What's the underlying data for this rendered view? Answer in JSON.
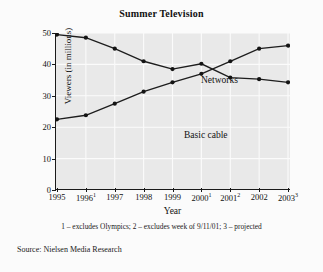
{
  "figure": {
    "title": "Summer Television",
    "footnote": "1 – excludes Olympics; 2 – excludes week of 9/11/01; 3 – projected",
    "source": "Source: Nielsen Media Research",
    "background_color": "#fbfbfb",
    "plot_background_color": "#e9e9e9",
    "line_color": "#1d1d1d",
    "grid_color": "#fbfbfb"
  },
  "axes": {
    "x_title": "Year",
    "y_title": "Viewers (in millions)",
    "y_ticks": [
      "0",
      "10",
      "20",
      "30",
      "40",
      "50"
    ],
    "x_ticks": [
      {
        "year": "1995",
        "note": ""
      },
      {
        "year": "1996",
        "note": "1"
      },
      {
        "year": "1997",
        "note": ""
      },
      {
        "year": "1998",
        "note": ""
      },
      {
        "year": "1999",
        "note": ""
      },
      {
        "year": "2000",
        "note": "1"
      },
      {
        "year": "2001",
        "note": "2"
      },
      {
        "year": "2002",
        "note": ""
      },
      {
        "year": "2003",
        "note": "3"
      }
    ]
  },
  "series_labels": {
    "networks": "Networks",
    "basic_cable": "Basic cable"
  },
  "chart_data": {
    "type": "line",
    "title": "Summer Television",
    "xlabel": "Year",
    "ylabel": "Viewers (in millions)",
    "categories": [
      "1995",
      "1996",
      "1997",
      "1998",
      "1999",
      "2000",
      "2001",
      "2002",
      "2003"
    ],
    "category_notes": [
      "",
      "1",
      "",
      "",
      "",
      "1",
      "2",
      "",
      "3"
    ],
    "ylim": [
      0,
      50
    ],
    "yticks": [
      0,
      10,
      20,
      30,
      40,
      50
    ],
    "grid": true,
    "legend": "inline-labels",
    "series": [
      {
        "name": "Networks",
        "values": [
          49.5,
          48.5,
          45.0,
          41.0,
          38.5,
          40.2,
          35.8,
          35.3,
          34.3
        ]
      },
      {
        "name": "Basic cable",
        "values": [
          22.5,
          23.8,
          27.5,
          31.3,
          34.3,
          37.0,
          41.0,
          45.0,
          46.0
        ]
      }
    ],
    "annotations": [
      "1 – excludes Olympics; 2 – excludes week of 9/11/01; 3 – projected",
      "Source: Nielsen Media Research"
    ]
  }
}
